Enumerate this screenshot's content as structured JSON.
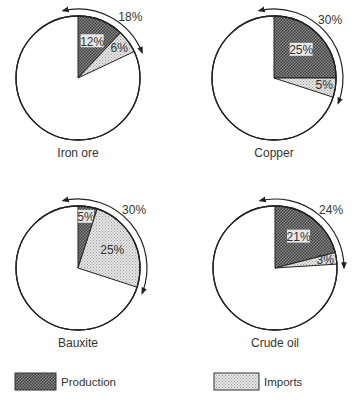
{
  "chart_data": {
    "type": "pie",
    "title": "",
    "legend": {
      "placement": "bottom",
      "entries": [
        {
          "name": "Production",
          "pattern": "dark-crosshatch",
          "color": "#6a6a6a"
        },
        {
          "name": "Imports",
          "pattern": "light-dots",
          "color": "#d6d6d6"
        }
      ]
    },
    "pies": [
      {
        "name": "Iron ore",
        "slices": [
          {
            "series": "Production",
            "value": 12,
            "label": "12%"
          },
          {
            "series": "Imports",
            "value": 6,
            "label": "6%"
          },
          {
            "series": "Other",
            "value": 82,
            "label": ""
          }
        ],
        "total_label": "18%"
      },
      {
        "name": "Copper",
        "slices": [
          {
            "series": "Production",
            "value": 25,
            "label": "25%"
          },
          {
            "series": "Imports",
            "value": 5,
            "label": "5%"
          },
          {
            "series": "Other",
            "value": 70,
            "label": ""
          }
        ],
        "total_label": "30%"
      },
      {
        "name": "Bauxite",
        "slices": [
          {
            "series": "Production",
            "value": 5,
            "label": "5%"
          },
          {
            "series": "Imports",
            "value": 25,
            "label": "25%"
          },
          {
            "series": "Other",
            "value": 70,
            "label": ""
          }
        ],
        "total_label": "30%"
      },
      {
        "name": "Crude oil",
        "slices": [
          {
            "series": "Production",
            "value": 21,
            "label": "21%"
          },
          {
            "series": "Imports",
            "value": 3,
            "label": "3%"
          },
          {
            "series": "Other",
            "value": 76,
            "label": ""
          }
        ],
        "total_label": "24%"
      }
    ]
  }
}
